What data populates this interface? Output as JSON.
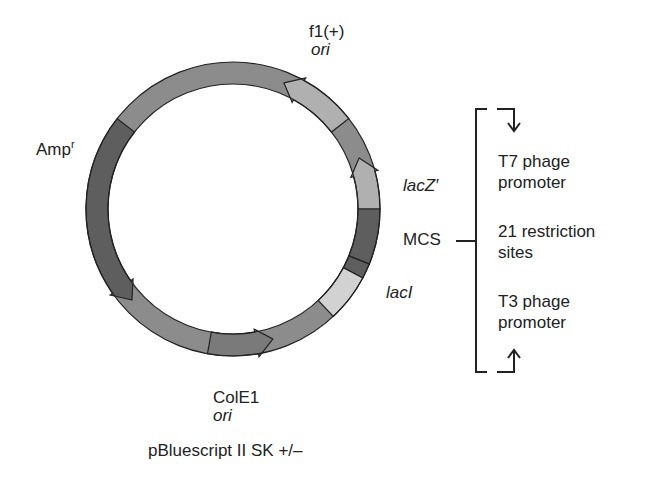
{
  "title": "pBluescript II SK +/–",
  "colors": {
    "backbone": "#8c8c8c",
    "dark": "#5e5e5e",
    "light": "#b0b0b0",
    "lighter": "#d2d2d2",
    "outline": "#222222"
  },
  "plasmid": {
    "center": [
      233,
      209
    ],
    "outer_radius": 147,
    "inner_radius": 125,
    "features": [
      {
        "name": "f1(+) ori",
        "start_deg": 22,
        "end_deg": 52,
        "shade": "light",
        "arrow": "ccw"
      },
      {
        "name": "lacZ'",
        "start_deg": 68,
        "end_deg": 90,
        "shade": "light",
        "arrow": "ccw"
      },
      {
        "name": "MCS",
        "start_deg": 90,
        "end_deg": 112,
        "shade": "dark",
        "arrow": "none"
      },
      {
        "name": "MCS-lacI junction",
        "start_deg": 112,
        "end_deg": 118,
        "shade": "dark",
        "arrow": "none"
      },
      {
        "name": "lacI",
        "start_deg": 118,
        "end_deg": 137,
        "shade": "lighter",
        "arrow": "none"
      },
      {
        "name": "ColE1 ori",
        "start_deg": 163,
        "end_deg": 190,
        "shade": "backbone-dark",
        "arrow": "ccw"
      },
      {
        "name": "Amp r",
        "start_deg": 228,
        "end_deg": 308,
        "shade": "dark",
        "arrow": "ccw"
      }
    ]
  },
  "labels": {
    "f1_line1": "f1(+)",
    "f1_line2": "ori",
    "amp_main": "Amp",
    "amp_sup": "r",
    "lacz": "lacZ′",
    "mcs": "MCS",
    "laci": "lacI",
    "cole1_line1": "ColE1",
    "cole1_line2": "ori"
  },
  "mcs_detail": {
    "t7_line1": "T7 phage",
    "t7_line2": "promoter",
    "sites_line1": "21 restriction",
    "sites_line2": "sites",
    "t3_line1": "T3 phage",
    "t3_line2": "promoter"
  }
}
